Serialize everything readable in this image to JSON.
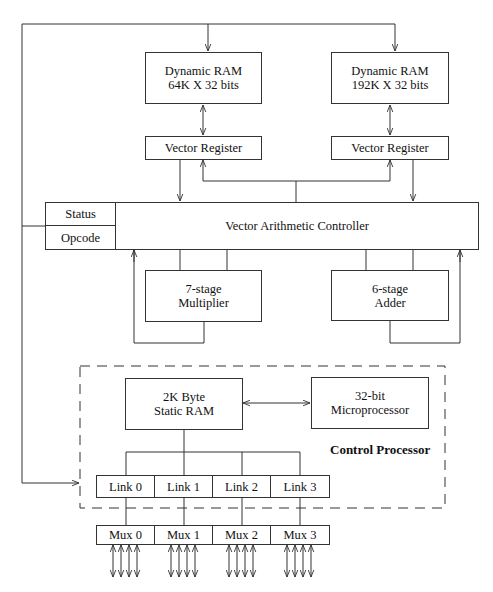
{
  "diagram": {
    "type": "block-diagram",
    "blocks": {
      "dram_left": {
        "line1": "Dynamic RAM",
        "line2": "64K X 32 bits"
      },
      "dram_right": {
        "line1": "Dynamic RAM",
        "line2": "192K X 32 bits"
      },
      "vector_register_left": {
        "label": "Vector Register"
      },
      "vector_register_right": {
        "label": "Vector Register"
      },
      "controller": {
        "label": "Vector Arithmetic Controller",
        "status": "Status",
        "opcode": "Opcode"
      },
      "multiplier": {
        "line1": "7-stage",
        "line2": "Multiplier"
      },
      "adder": {
        "line1": "6-stage",
        "line2": "Adder"
      },
      "static_ram": {
        "line1": "2K Byte",
        "line2": "Static RAM"
      },
      "microprocessor": {
        "line1": "32-bit",
        "line2": "Microprocessor"
      }
    },
    "control_processor_label": "Control Processor",
    "links": [
      "Link 0",
      "Link 1",
      "Link 2",
      "Link 3"
    ],
    "muxes": [
      "Mux 0",
      "Mux 1",
      "Mux 2",
      "Mux 3"
    ],
    "mux_io_lines_per_mux": 4
  }
}
